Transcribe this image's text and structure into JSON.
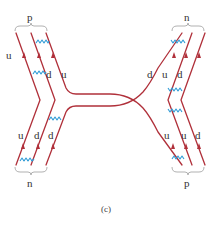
{
  "figure": {
    "caption": "(c)",
    "colors": {
      "quark_line": "#b0303a",
      "gluon": "#2f9bd6",
      "brace": "#a8a8a8",
      "text": "#333333"
    },
    "top_left_group": {
      "hadron": "p",
      "quarks": [
        "u",
        "d",
        "u"
      ]
    },
    "top_right_group": {
      "hadron": "n",
      "quarks": [
        "d",
        "u",
        "d"
      ]
    },
    "bottom_left_group": {
      "hadron": "n",
      "quarks": [
        "u",
        "d",
        "d"
      ]
    },
    "bottom_right_group": {
      "hadron": "p",
      "quarks": [
        "u",
        "u",
        "d"
      ]
    }
  }
}
